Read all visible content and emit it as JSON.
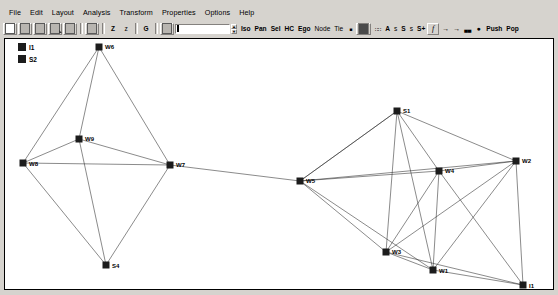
{
  "app": {
    "title": "Network Visualization",
    "canvas_bg": "#ffffff",
    "chrome_bg": "#d6d3ce",
    "node_color": "#1c1c1c",
    "edge_color": "#2b2b2b"
  },
  "menubar": {
    "items": [
      {
        "label": "File"
      },
      {
        "label": "Edit"
      },
      {
        "label": "Layout"
      },
      {
        "label": "Analysis"
      },
      {
        "label": "Transform"
      },
      {
        "label": "Properties"
      },
      {
        "label": "Options"
      },
      {
        "label": "Help"
      }
    ]
  },
  "toolbar": {
    "icons": [
      {
        "name": "new-document-icon",
        "kind": "doc"
      },
      {
        "name": "open-document-icon",
        "kind": "doc-gray"
      },
      {
        "name": "save-document-icon",
        "kind": "doc-gray"
      },
      {
        "name": "save-as-document-icon",
        "kind": "doc-arrow"
      },
      {
        "name": "print-icon",
        "kind": "doc-gray"
      },
      {
        "name": "copy-icon",
        "kind": "doc-gray"
      }
    ],
    "letters": [
      {
        "name": "z-button",
        "label": "Z"
      },
      {
        "name": "z-small-button",
        "label": "z"
      },
      {
        "name": "g-button",
        "label": "G"
      }
    ],
    "spin_value": "",
    "spin_placeholder": "",
    "modes": [
      {
        "name": "iso-button",
        "label": "Iso"
      },
      {
        "name": "pan-button",
        "label": "Pan"
      },
      {
        "name": "sel-button",
        "label": "Sel"
      },
      {
        "name": "hc-button",
        "label": "HC"
      },
      {
        "name": "ego-button",
        "label": "Ego"
      },
      {
        "name": "node-button",
        "label": "Node"
      },
      {
        "name": "tie-button",
        "label": "Tie"
      }
    ],
    "sizes": [
      {
        "name": "a-button",
        "label": "A"
      },
      {
        "name": "s-lower-button",
        "label": "s"
      },
      {
        "name": "s-upper-button",
        "label": "S"
      },
      {
        "name": "s-lower2-button",
        "label": "s"
      },
      {
        "name": "s-plus-button",
        "label": "S+"
      }
    ],
    "push_label": "Push",
    "pop_label": "Pop"
  },
  "legend": {
    "items": [
      {
        "label": "I1",
        "color": "#1c1c1c"
      },
      {
        "label": "S2",
        "color": "#1c1c1c"
      }
    ]
  },
  "graph": {
    "nodes": [
      {
        "id": "W6",
        "x": 94,
        "y": 8,
        "label": "W6",
        "label_dx": 6,
        "label_dy": 2
      },
      {
        "id": "W9",
        "x": 74,
        "y": 100,
        "label": "W9",
        "label_dx": 6,
        "label_dy": 2
      },
      {
        "id": "W8",
        "x": 18,
        "y": 124,
        "label": "W8",
        "label_dx": 6,
        "label_dy": 3
      },
      {
        "id": "W7",
        "x": 165,
        "y": 126,
        "label": "W7",
        "label_dx": 6,
        "label_dy": 2
      },
      {
        "id": "S4",
        "x": 101,
        "y": 226,
        "label": "S4",
        "label_dx": 6,
        "label_dy": 3
      },
      {
        "id": "W5",
        "x": 295,
        "y": 142,
        "label": "W5",
        "label_dx": 6,
        "label_dy": 2
      },
      {
        "id": "S1",
        "x": 392,
        "y": 72,
        "label": "S1",
        "label_dx": 6,
        "label_dy": 2
      },
      {
        "id": "W4",
        "x": 434,
        "y": 132,
        "label": "W4",
        "label_dx": 6,
        "label_dy": 2
      },
      {
        "id": "W2",
        "x": 511,
        "y": 122,
        "label": "W2",
        "label_dx": 6,
        "label_dy": 2
      },
      {
        "id": "W3",
        "x": 381,
        "y": 213,
        "label": "W3",
        "label_dx": 6,
        "label_dy": 2
      },
      {
        "id": "W1",
        "x": 428,
        "y": 231,
        "label": "W1",
        "label_dx": 6,
        "label_dy": 3
      },
      {
        "id": "I1",
        "x": 518,
        "y": 246,
        "label": "I1",
        "label_dx": 6,
        "label_dy": 3
      }
    ],
    "edges": [
      [
        "W6",
        "W8"
      ],
      [
        "W6",
        "W9"
      ],
      [
        "W6",
        "W7"
      ],
      [
        "W9",
        "W8"
      ],
      [
        "W9",
        "W7"
      ],
      [
        "W9",
        "S4"
      ],
      [
        "W8",
        "W7"
      ],
      [
        "W8",
        "S4"
      ],
      [
        "W7",
        "S4"
      ],
      [
        "W7",
        "W5"
      ],
      [
        "W5",
        "S1"
      ],
      [
        "W5",
        "W4"
      ],
      [
        "W5",
        "W2"
      ],
      [
        "W5",
        "W3"
      ],
      [
        "W5",
        "W1"
      ],
      [
        "S1",
        "W4"
      ],
      [
        "S1",
        "W2"
      ],
      [
        "S1",
        "W3"
      ],
      [
        "S1",
        "W1"
      ],
      [
        "S1",
        "W5"
      ],
      [
        "W4",
        "W2"
      ],
      [
        "W4",
        "W3"
      ],
      [
        "W4",
        "W1"
      ],
      [
        "W4",
        "I1"
      ],
      [
        "W2",
        "W3"
      ],
      [
        "W2",
        "W1"
      ],
      [
        "W2",
        "I1"
      ],
      [
        "W3",
        "W1"
      ],
      [
        "W1",
        "I1"
      ],
      [
        "W3",
        "I1"
      ]
    ],
    "node_size": 7
  }
}
